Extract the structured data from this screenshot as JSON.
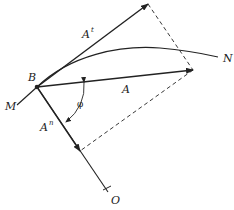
{
  "diagram": {
    "type": "vector-decomposition",
    "colors": {
      "stroke": "#222222",
      "background": "#ffffff"
    },
    "points": {
      "B": {
        "label": "B",
        "x": 37,
        "y": 87
      },
      "M": {
        "label": "M",
        "x": 17,
        "y": 105
      },
      "N": {
        "label": "N",
        "x": 218,
        "y": 57
      },
      "O": {
        "label": "O",
        "x": 108,
        "y": 192
      }
    },
    "vectors": {
      "A": {
        "label": "A",
        "tip": [
          193,
          70
        ]
      },
      "A_tangential": {
        "label": "A",
        "superscript": "t",
        "tip": [
          148,
          4
        ]
      },
      "A_normal": {
        "label": "A",
        "superscript": "n",
        "tip": [
          80,
          151
        ]
      }
    },
    "angle": {
      "label": "φ"
    },
    "labels": {
      "B": "B",
      "M": "M",
      "N": "N",
      "O": "O",
      "A": "A",
      "At_base": "A",
      "At_sup": "t",
      "An_base": "A",
      "An_sup": "n",
      "phi": "φ"
    }
  }
}
